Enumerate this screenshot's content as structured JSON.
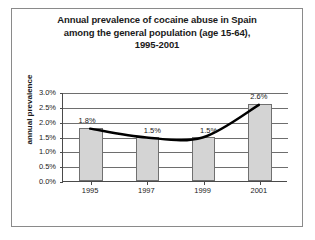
{
  "title": {
    "line1": "Annual prevalence of cocaine abuse in Spain",
    "line2": "among the general population (age 15-64),",
    "line3": "1995-2001"
  },
  "axes": {
    "ylabel": "annual prevalence",
    "yticks": [
      "3.0%",
      "2.5%",
      "2.0%",
      "1.5%",
      "1.0%",
      "0.5%",
      "0.0%"
    ],
    "xticks": [
      "1995",
      "1997",
      "1999",
      "2001"
    ]
  },
  "data_labels": [
    "1.8%",
    "1.5%",
    "1.5%",
    "2.6%"
  ],
  "colors": {
    "bar_fill": "#d4d4d4",
    "bar_border": "#707070",
    "line": "#000000",
    "grid": "#6e6e6e",
    "axis": "#4a4a4a",
    "frame": "#8a8a8a",
    "text": "#1a1a1a",
    "background": "#ffffff"
  },
  "chart_data": {
    "type": "bar",
    "title": "Annual prevalence of cocaine abuse in Spain among the general population (age 15-64), 1995-2001",
    "xlabel": "",
    "ylabel": "annual prevalence",
    "categories": [
      "1995",
      "1997",
      "1999",
      "2001"
    ],
    "values": [
      1.8,
      1.5,
      1.5,
      2.6
    ],
    "value_labels": [
      "1.8%",
      "1.5%",
      "1.5%",
      "2.6%"
    ],
    "ylim": [
      0.0,
      3.0
    ],
    "ytick_values": [
      0.0,
      0.5,
      1.0,
      1.5,
      2.0,
      2.5,
      3.0
    ],
    "ytick_labels": [
      "0.0%",
      "0.5%",
      "1.0%",
      "1.5%",
      "2.0%",
      "2.5%",
      "3.0%"
    ],
    "grid": true,
    "legend": false,
    "series": [
      {
        "name": "annual prevalence",
        "type": "bar",
        "values": [
          1.8,
          1.5,
          1.5,
          2.6
        ]
      },
      {
        "name": "trend",
        "type": "line",
        "values": [
          1.8,
          1.5,
          1.5,
          2.6
        ]
      }
    ],
    "units": "percent"
  }
}
